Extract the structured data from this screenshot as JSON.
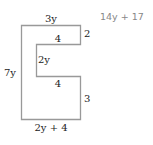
{
  "diagram": {
    "type": "rectilinear-polygon",
    "shape_color": "#999999",
    "labels": {
      "top": "3y",
      "top_right": "2",
      "upper_inner": "4",
      "inner_vertical": "2y",
      "lower_inner": "4",
      "lower_right": "3",
      "left": "7y",
      "bottom": "2y + 4"
    },
    "answer": "14y + 17"
  }
}
